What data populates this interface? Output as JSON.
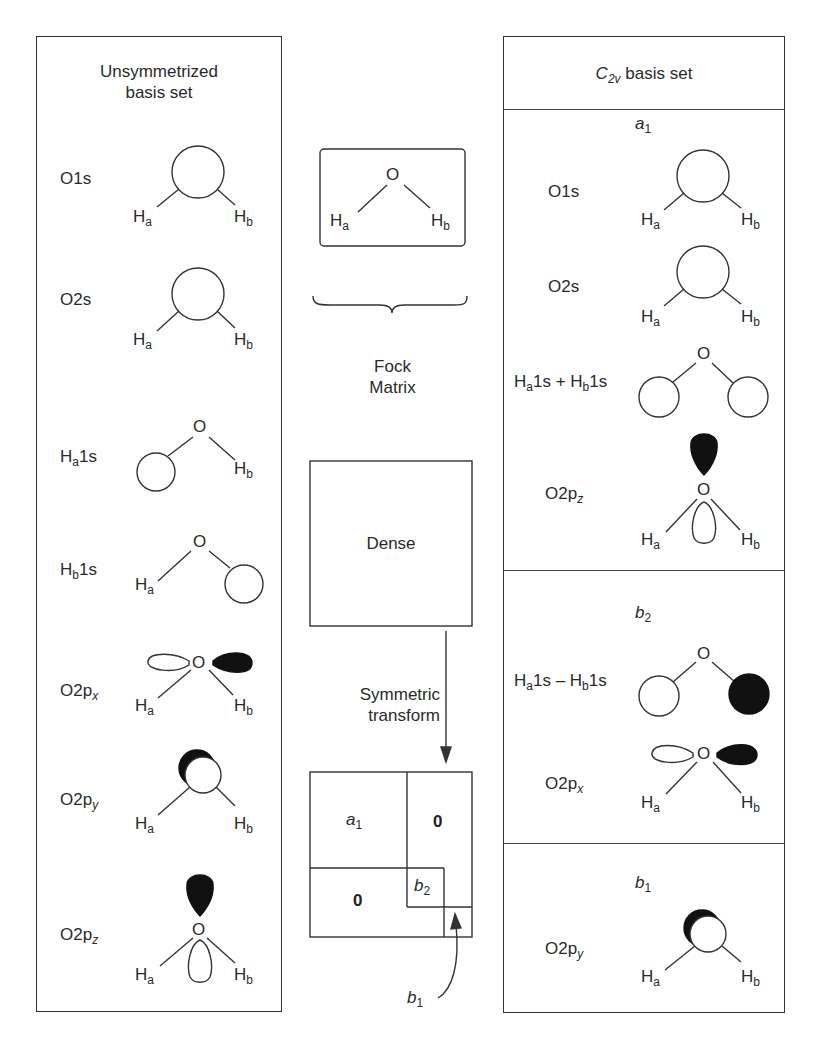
{
  "left_panel": {
    "title_line1": "Unsymmetrized",
    "title_line2": "basis set",
    "rows": [
      {
        "label": "O1s",
        "orbital": "O 1s (centered on O)"
      },
      {
        "label": "O2s",
        "orbital": "O 2s (centered on O)"
      },
      {
        "label_main": "H",
        "label_sub": "a",
        "label_tail": "1s",
        "orbital": "H_a 1s"
      },
      {
        "label_main": "H",
        "label_sub": "b",
        "label_tail": "1s",
        "orbital": "H_b 1s"
      },
      {
        "label_main": "O2p",
        "label_sub": "x",
        "orbital": "O 2p_x"
      },
      {
        "label_main": "O2p",
        "label_sub": "y",
        "orbital": "O 2p_y"
      },
      {
        "label_main": "O2p",
        "label_sub": "z",
        "orbital": "O 2p_z"
      }
    ]
  },
  "atoms": {
    "oxygen": "O",
    "h": "H",
    "ha_sub": "a",
    "hb_sub": "b"
  },
  "middle": {
    "fock_line1": "Fock",
    "fock_line2": "Matrix",
    "dense_label": "Dense",
    "transform_line1": "Symmetric",
    "transform_line2": "transform",
    "blocks": {
      "a1": {
        "main": "a",
        "sub": "1"
      },
      "b2": {
        "main": "b",
        "sub": "2"
      },
      "b1": {
        "main": "b",
        "sub": "1"
      },
      "zero": "0"
    }
  },
  "right_panel": {
    "title_main": "C",
    "title_sub": "2v",
    "title_tail": " basis set",
    "sections": [
      {
        "symmetry_main": "a",
        "symmetry_sub": "1",
        "rows": [
          {
            "label": "O1s"
          },
          {
            "label": "O2s"
          },
          {
            "label": "Ha1s + Hb1s",
            "p1": "H",
            "s1": "a",
            "t1": "1s + ",
            "p2": "H",
            "s2": "b",
            "t2": "1s"
          },
          {
            "label_main": "O2p",
            "label_sub": "z"
          }
        ]
      },
      {
        "symmetry_main": "b",
        "symmetry_sub": "2",
        "rows": [
          {
            "label": "Ha1s – Hb1s",
            "p1": "H",
            "s1": "a",
            "t1": "1s – ",
            "p2": "H",
            "s2": "b",
            "t2": "1s"
          },
          {
            "label_main": "O2p",
            "label_sub": "x"
          }
        ]
      },
      {
        "symmetry_main": "b",
        "symmetry_sub": "1",
        "rows": [
          {
            "label_main": "O2p",
            "label_sub": "y"
          }
        ]
      }
    ]
  },
  "colors": {
    "line": "#333333",
    "fill_dark": "#111111",
    "background": "#ffffff"
  }
}
